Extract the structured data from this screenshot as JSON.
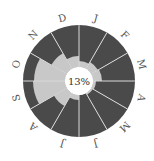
{
  "chart_data": {
    "type": "radial-bar",
    "title": "",
    "center_label": "13%",
    "categories": [
      "J",
      "F",
      "M",
      "A",
      "M",
      "J",
      "J",
      "A",
      "S",
      "O",
      "N",
      "D"
    ],
    "months_full": [
      "Jan",
      "Feb",
      "Mar",
      "Apr",
      "May",
      "Jun",
      "Jul",
      "Aug",
      "Sep",
      "Oct",
      "Nov",
      "Dec"
    ],
    "series": [
      {
        "name": "value",
        "color": "#c8c8c8",
        "values_radius_px": [
          20,
          22,
          23,
          17,
          16,
          14,
          19,
          29,
          46,
          45,
          32,
          25
        ]
      },
      {
        "name": "remainder",
        "color": "#4a4a4a"
      }
    ],
    "inner_radius_px": 14,
    "outer_radius_px": 56,
    "start_angle": "12 o'clock, clockwise",
    "grid": false,
    "legend": "none"
  },
  "colors": {
    "dark": "#4a4a4a",
    "light": "#c8c8c8",
    "divider": "#d9d9d9",
    "background": "#ffffff"
  }
}
